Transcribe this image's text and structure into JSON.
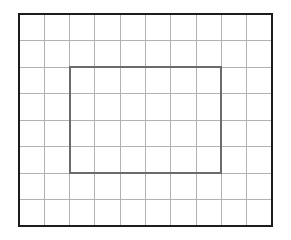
{
  "figure": {
    "canvas": {
      "width": 291,
      "height": 240,
      "background": "#ffffff"
    },
    "grid": {
      "label": "grid",
      "columns": 10,
      "rows": 8,
      "x": 19,
      "y": 14,
      "width": 253,
      "height": 212,
      "cell_width": 25.3,
      "cell_height": 26.5,
      "line_color": "#b2b2b2",
      "line_width": 1
    },
    "outer_border": {
      "label": "outer-frame",
      "x": 19,
      "y": 14,
      "width": 253,
      "height": 212,
      "stroke_color": "#1c1c1c",
      "stroke_width": 2.5,
      "fill": "none"
    },
    "inner_rectangle": {
      "label": "inner-rectangle",
      "x": 70.6,
      "y": 67,
      "width": 151.8,
      "height": 106,
      "grid_col_start": 2,
      "grid_col_end": 8,
      "grid_row_start": 2,
      "grid_row_end": 6,
      "cells_wide": 6,
      "cells_tall": 4,
      "area_cells": 24,
      "stroke_color": "#6b6b6b",
      "stroke_width": 2,
      "fill": "none"
    }
  }
}
